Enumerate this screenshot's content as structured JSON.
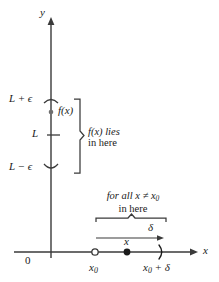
{
  "figure": {
    "kind": "epsilon-delta limit definition diagram",
    "axes": {
      "y_axis_label": "y",
      "x_axis_label": "x",
      "origin_label": "0"
    },
    "y_marks": [
      {
        "id": "upper",
        "label": "L + ϵ",
        "y": 100
      },
      {
        "id": "limit",
        "label": "L",
        "y": 135
      },
      {
        "id": "lower",
        "label": "L − ϵ",
        "y": 168
      }
    ],
    "function_point": {
      "label": "f(x)",
      "x": 51,
      "y": 112
    },
    "range_brace": {
      "caption_line1": "f(x) lies",
      "caption_line2": "in here",
      "top": 100,
      "bottom": 172
    },
    "domain_brace": {
      "caption_line1": "for all x ≠ x",
      "caption_line1_sub": "0",
      "caption_line2": "in here",
      "left": 96,
      "right": 166
    },
    "delta_arrow": {
      "label": "δ",
      "left": 96,
      "right": 163
    },
    "x_marks": [
      {
        "id": "x0",
        "label": "x",
        "sub": "0",
        "x": 95,
        "style": "open-circle"
      },
      {
        "id": "x",
        "label": "x",
        "sub": "",
        "x": 127,
        "style": "filled-dot"
      },
      {
        "id": "x0plusdelta",
        "label": "x",
        "sub": "0",
        "suffix": " + δ",
        "x": 162,
        "style": "paren"
      }
    ],
    "colors": {
      "ink": "#1a1a1a",
      "rule": "#3a3a3a",
      "background": "#ffffff"
    }
  }
}
